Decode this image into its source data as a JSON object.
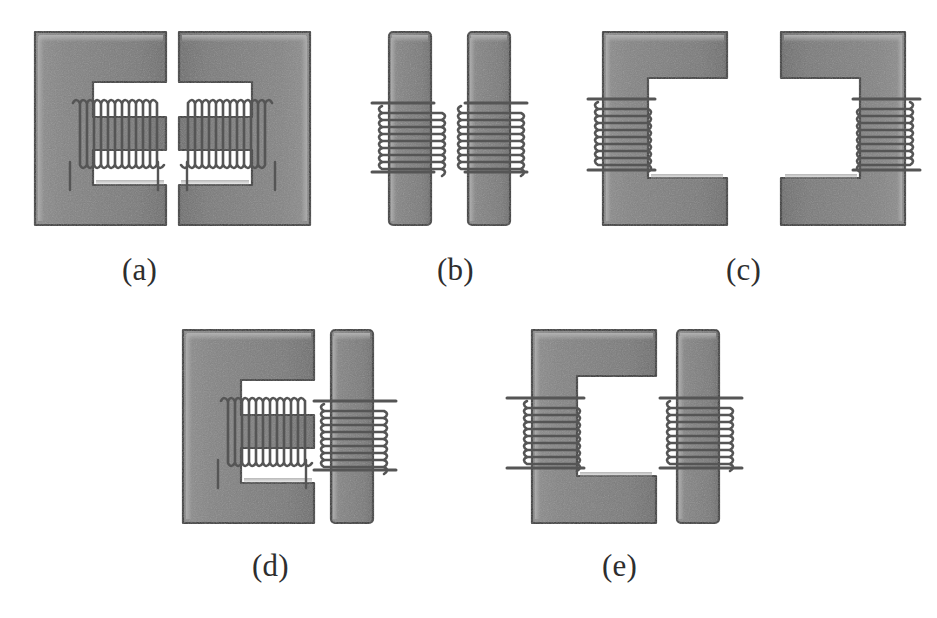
{
  "figure": {
    "width": 937,
    "height": 618,
    "background_color": "#ffffff",
    "core_fill_color": "#808080",
    "core_outline_color": "#3a3a3a",
    "core_highlight_color": "#a8a8a8",
    "core_shadow_color": "#606060",
    "coil_color": "#5a5a5a",
    "lead_color": "#4a4a4a",
    "label_color": "#2e2e2e"
  },
  "panels": [
    {
      "id": "a",
      "label": "(a)",
      "label_x": 122,
      "label_y": 252,
      "description": "Two facing E-cores, each with a coil wound on the horizontal center leg",
      "core_left": {
        "shape": "E-core",
        "orientation": "opens-right",
        "winding": "center-leg",
        "turns": 13
      },
      "core_right": {
        "shape": "E-core",
        "orientation": "opens-left",
        "winding": "center-leg",
        "turns": 13
      }
    },
    {
      "id": "b",
      "label": "(b)",
      "label_x": 437,
      "label_y": 252,
      "description": "Two parallel I-bars, each with a coil wound around the bar with external leads",
      "core_left": {
        "shape": "I-bar",
        "orientation": "vertical",
        "winding": "full-bar",
        "turns": 10
      },
      "core_right": {
        "shape": "I-bar",
        "orientation": "vertical",
        "winding": "full-bar",
        "turns": 10
      }
    },
    {
      "id": "c",
      "label": "(c)",
      "label_x": 726,
      "label_y": 252,
      "description": "Two facing C-cores, each with a coil wound on the outer vertical back leg",
      "core_left": {
        "shape": "C-core",
        "orientation": "opens-right",
        "winding": "back-leg",
        "turns": 10
      },
      "core_right": {
        "shape": "C-core",
        "orientation": "opens-left",
        "winding": "back-leg",
        "turns": 10
      }
    },
    {
      "id": "d",
      "label": "(d)",
      "label_x": 252,
      "label_y": 548,
      "description": "One E-core with center-leg winding facing one wound I-bar",
      "core_left": {
        "shape": "E-core",
        "orientation": "opens-right",
        "winding": "center-leg",
        "turns": 13
      },
      "core_right": {
        "shape": "I-bar",
        "orientation": "vertical",
        "winding": "full-bar",
        "turns": 10
      }
    },
    {
      "id": "e",
      "label": "(e)",
      "label_x": 602,
      "label_y": 548,
      "description": "One C-core with back-leg winding facing one wound I-bar",
      "core_left": {
        "shape": "C-core",
        "orientation": "opens-right",
        "winding": "back-leg",
        "turns": 10
      },
      "core_right": {
        "shape": "I-bar",
        "orientation": "vertical",
        "winding": "full-bar",
        "turns": 10
      }
    }
  ],
  "labels": {
    "a": "(a)",
    "b": "(b)",
    "c": "(c)",
    "d": "(d)",
    "e": "(e)"
  }
}
